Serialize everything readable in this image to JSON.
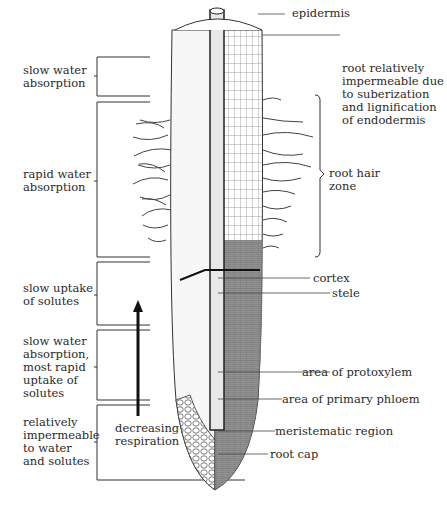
{
  "figure": {
    "left_zones": [
      {
        "label": "slow water\nabsorption"
      },
      {
        "label": "rapid water\nabsorption"
      },
      {
        "label": "slow uptake\nof solutes"
      },
      {
        "label": "slow water\nabsorption,\nmost rapid\nuptake of\nsolutes"
      },
      {
        "label": "relatively\nimpermeable\nto water\nand solutes"
      }
    ],
    "arrow_label": "decreasing\nrespiration",
    "right_labels": {
      "epidermis": "epidermis",
      "impermeable": "root relatively\nimpermeable due\nto suberization\nand lignification\nof endodermis",
      "root_hair_zone": "root hair\nzone",
      "cortex": "cortex",
      "stele": "stele",
      "protoxylem": "area of protoxylem",
      "phloem": "area of primary phloem",
      "meristem": "meristematic region",
      "root_cap": "root cap"
    }
  }
}
